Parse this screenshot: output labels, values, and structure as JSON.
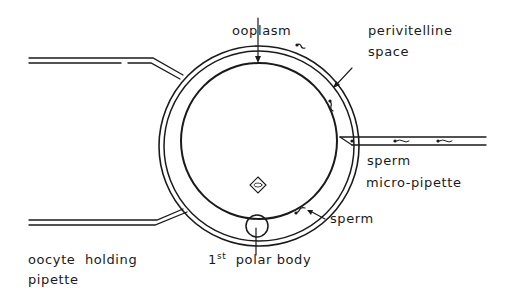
{
  "diagram": {
    "labels": {
      "ooplasm": "ooplasm",
      "perivitelline_line1": "perivitelline",
      "perivitelline_line2": "space",
      "sperm_pipette_line1": "sperm",
      "sperm_pipette_line2": "micro-pipette",
      "sperm": "sperm",
      "polar_body_ordinal": "1",
      "polar_body_sup": "st",
      "polar_body_text": "polar body",
      "holding_pipette_line1": "oocyte  holding",
      "holding_pipette_line2": "pipette"
    },
    "nucleus_symbol": "nucleus-diamond-icon",
    "colors": {
      "line": "#1a1a1a",
      "background": "#ffffff"
    }
  }
}
